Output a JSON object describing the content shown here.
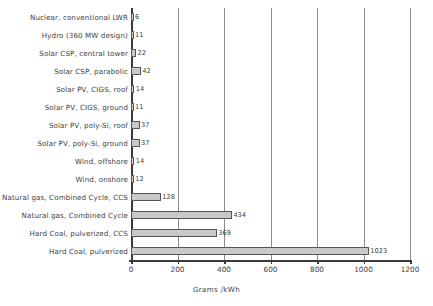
{
  "chart_data": {
    "type": "bar",
    "orientation": "horizontal",
    "title": "",
    "xlabel": "Grams /kWh",
    "ylabel": "",
    "xlim": [
      0,
      1200
    ],
    "xticks": [
      0,
      200,
      400,
      600,
      800,
      1000,
      1200
    ],
    "xtick_labels": [
      "0",
      "200",
      "400",
      "600",
      "800",
      "1000",
      "1200"
    ],
    "grid": true,
    "legend": "none",
    "bar_fill_color": "#c9c9c9",
    "bar_border_color": "#565656",
    "gridline_color": "#8c8c8c",
    "axis_color": "#3a3a3a",
    "categories": [
      "Nuclear, conventional LWR",
      "Hydro (360 MW design)",
      "Solar CSP, central tower",
      "Solar CSP, parabolic",
      "Solar PV, CIGS, roof",
      "Solar PV, CIGS, ground",
      "Solar PV, poly-Si, roof",
      "Solar PV, poly-Si, ground",
      "Wind, offshore",
      "Wind, onshore",
      "Natural gas, Combined Cycle, CCS",
      "Natural gas, Combined Cycle",
      "Hard Coal, pulverized, CCS",
      "Hard Coal, pulverized"
    ],
    "values": [
      6,
      11,
      22,
      42,
      14,
      11,
      37,
      37,
      14,
      12,
      128,
      434,
      369,
      1023
    ],
    "value_labels": [
      "6",
      "11",
      "22",
      "42",
      "14",
      "11",
      "37",
      "37",
      "14",
      "12",
      "128",
      "434",
      "369",
      "1023"
    ]
  }
}
